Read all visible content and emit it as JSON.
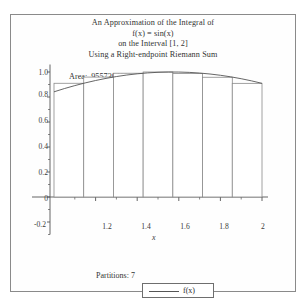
{
  "title": {
    "lines": [
      "An Approximation of the Integral of",
      "f(x) = sin(x)",
      "on the Interval [1, 2]",
      "Using a Right-endpoint Riemann Sum"
    ],
    "area_label": "Area:",
    "area_value": ".9557304698",
    "area_line": "Area: .9557304698"
  },
  "footer": {
    "partitions_label": "Partitions:",
    "partitions_value": "7",
    "partitions_line": "Partitions: 7"
  },
  "legend": {
    "entries": [
      {
        "label": "f(x)",
        "color": "#555555"
      }
    ]
  },
  "axes": {
    "x_title": "x",
    "y_title": "",
    "x_ticks": [
      "1.2",
      "1.4",
      "1.6",
      "1.8",
      "2"
    ],
    "x_tick_values": [
      1.2,
      1.4,
      1.6,
      1.8,
      2.0
    ],
    "y_ticks": [
      "1.0",
      "0.8",
      "0.6",
      "0.4",
      "0.2",
      "0",
      "-0.2"
    ],
    "y_tick_values": [
      1.0,
      0.8,
      0.6,
      0.4,
      0.2,
      0.0,
      -0.2
    ]
  },
  "chart_data": {
    "type": "bar",
    "title": "An Approximation of the Integral of f(x) = sin(x) on the Interval [1, 2] Using a Right-endpoint Riemann Sum",
    "xlabel": "x",
    "ylabel": "",
    "xlim": [
      0.97,
      2.06
    ],
    "ylim": [
      -0.3,
      1.08
    ],
    "grid": false,
    "legend_position": "bottom",
    "function": "sin(x)",
    "interval": [
      1,
      2
    ],
    "partitions": 7,
    "method": "right-endpoint",
    "area": 0.9557304698,
    "bar_edges": [
      1.0,
      1.142857,
      1.285714,
      1.428571,
      1.571429,
      1.714286,
      1.857143,
      2.0
    ],
    "categories": [
      "1.000-1.143",
      "1.143-1.286",
      "1.286-1.429",
      "1.429-1.571",
      "1.571-1.714",
      "1.714-1.857",
      "1.857-2.000"
    ],
    "values": [
      0.90982,
      0.95935,
      0.99017,
      0.99997,
      0.98876,
      0.95793,
      0.9093
    ],
    "series": [
      {
        "name": "right-endpoint rectangles",
        "values": [
          0.90982,
          0.95935,
          0.99017,
          0.99997,
          0.98876,
          0.95793,
          0.9093
        ]
      },
      {
        "name": "f(x)",
        "type": "line",
        "x": [
          1.0,
          1.05,
          1.1,
          1.15,
          1.2,
          1.25,
          1.3,
          1.35,
          1.4,
          1.45,
          1.5,
          1.55,
          1.6,
          1.65,
          1.7,
          1.75,
          1.8,
          1.85,
          1.9,
          1.95,
          2.0
        ],
        "y": [
          0.84147,
          0.86742,
          0.89121,
          0.91276,
          0.93204,
          0.94898,
          0.96356,
          0.97572,
          0.98545,
          0.99271,
          0.99749,
          0.99978,
          0.99957,
          0.99687,
          0.99166,
          0.98399,
          0.97385,
          0.96128,
          0.9463,
          0.92896,
          0.9093
        ]
      }
    ],
    "colors": {
      "bar_edge": "#8a8a8a",
      "bar_fill": "#ffffff",
      "curve": "#555555",
      "axis": "#555555"
    }
  }
}
